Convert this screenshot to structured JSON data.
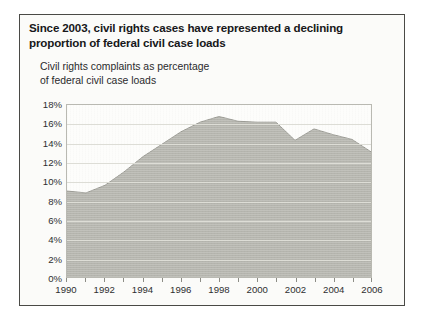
{
  "figure": {
    "title": "Since 2003, civil rights cases have represented a declining proportion of federal civil case loads",
    "subtitle_line1": "Civil rights complaints as percentage",
    "subtitle_line2": "of federal civil case loads",
    "border_color": "#4a4a46",
    "background_color": "#fbfbf9"
  },
  "chart_data": {
    "type": "area",
    "title": "Since 2003, civil rights cases have represented a declining proportion of federal civil case loads",
    "subtitle": "Civil rights complaints as percentage of federal civil case loads",
    "xlabel": "",
    "ylabel": "",
    "xlim": [
      1990,
      2006
    ],
    "ylim": [
      0,
      18
    ],
    "grid": true,
    "legend": false,
    "fill_color": "#b5b5ae",
    "line_color": "#9a9a93",
    "ytick_labels": [
      "18%",
      "16%",
      "14%",
      "12%",
      "10%",
      "8%",
      "6%",
      "4%",
      "2%",
      "0%"
    ],
    "ytick_values": [
      18,
      16,
      14,
      12,
      10,
      8,
      6,
      4,
      2,
      0
    ],
    "xtick_labels": [
      "1990",
      "1992",
      "1994",
      "1996",
      "1998",
      "2000",
      "2002",
      "2004",
      "2006"
    ],
    "xtick_values": [
      1990,
      1992,
      1994,
      1996,
      1998,
      2000,
      2002,
      2004,
      2006
    ],
    "xminor_values": [
      1991,
      1993,
      1995,
      1997,
      1999,
      2001,
      2003,
      2005
    ],
    "x": [
      1990,
      1991,
      1992,
      1993,
      1994,
      1995,
      1996,
      1997,
      1998,
      1999,
      2000,
      2001,
      2002,
      2003,
      2004,
      2005,
      2006
    ],
    "values": [
      9.0,
      8.8,
      9.6,
      11.0,
      12.6,
      13.9,
      15.2,
      16.2,
      16.8,
      16.3,
      16.2,
      16.2,
      14.3,
      15.5,
      14.9,
      14.4,
      13.1
    ],
    "units": "percent"
  }
}
